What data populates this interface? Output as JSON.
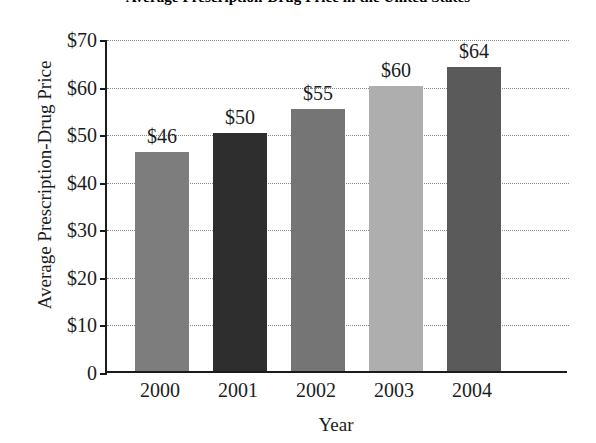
{
  "chart_data": {
    "type": "bar",
    "title": "Average Prescription-Drug Price in the United States",
    "xlabel": "Year",
    "ylabel": "Average Prescription-Drug Price",
    "categories": [
      "2000",
      "2001",
      "2002",
      "2003",
      "2004"
    ],
    "values": [
      46,
      50,
      55,
      60,
      64
    ],
    "value_labels": [
      "$46",
      "$50",
      "$55",
      "$60",
      "$64"
    ],
    "bar_colors": [
      "#7d7d7d",
      "#2e2e2e",
      "#757575",
      "#aeaeae",
      "#5a5a5a"
    ],
    "ylim": [
      0,
      70
    ],
    "ytick_values": [
      70,
      60,
      50,
      40,
      30,
      20,
      10,
      0
    ],
    "ytick_labels": [
      "$70",
      "$60",
      "$50",
      "$40",
      "$30",
      "$20",
      "$10",
      "0"
    ],
    "grid": true,
    "grid_style": "dotted-horizontal",
    "legend": "none",
    "axis_color": "#1b1b1b",
    "background_color": "#ffffff"
  }
}
